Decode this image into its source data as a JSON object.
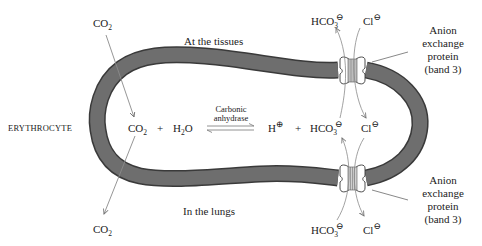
{
  "diagram": {
    "cell_label": "ERYTHROCYTE",
    "regions": {
      "top": "At the tissues",
      "bottom": "In the lungs"
    },
    "co2_top": {
      "main": "CO",
      "sub": "2"
    },
    "co2_bottom": {
      "main": "CO",
      "sub": "2"
    },
    "equation": {
      "co2": {
        "main": "CO",
        "sub": "2"
      },
      "plus1": "+",
      "h2o": {
        "pre": "H",
        "sub": "2",
        "post": "O"
      },
      "enzyme_line1": "Carbonic",
      "enzyme_line2": "anhydrase",
      "proton": {
        "main": "H",
        "charge": "⊕"
      },
      "plus2": "+",
      "bicarbonate": {
        "main": "HCO",
        "sub": "3",
        "charge": "⊖"
      },
      "chloride": {
        "main": "Cl",
        "charge": "⊖"
      }
    },
    "transporter_top": {
      "bicarbonate": {
        "main": "HCO",
        "sub": "3",
        "charge": "⊖"
      },
      "chloride": {
        "main": "Cl",
        "charge": "⊖"
      },
      "label_lines": [
        "Anion",
        "exchange",
        "protein",
        "(band 3)"
      ]
    },
    "transporter_bottom": {
      "bicarbonate": {
        "main": "HCO",
        "sub": "3",
        "charge": "⊖"
      },
      "chloride": {
        "main": "Cl",
        "charge": "⊖"
      },
      "label_lines": [
        "Anion",
        "exchange",
        "protein",
        "(band 3)"
      ]
    },
    "colors": {
      "membrane": "#6e6e6e",
      "membrane_edge": "#3a3a3a",
      "arrow": "#8a8a8a",
      "channel": "#bdbdbd",
      "text": "#222222"
    }
  }
}
